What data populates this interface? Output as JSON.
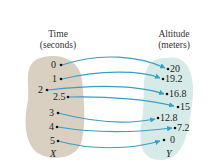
{
  "diagram": {
    "type": "function-mapping",
    "domain_header": {
      "line1": "Time",
      "line2": "(seconds)"
    },
    "range_header": {
      "line1": "Altitude",
      "line2": "(meters)"
    },
    "domain_label": "X",
    "range_label": "Y",
    "domain_values": [
      "0",
      "1",
      "2",
      "2.5",
      "3",
      "4",
      "5"
    ],
    "range_values": [
      "20",
      "19.2",
      "16.8",
      "15",
      "12.8",
      "7.2",
      "0"
    ],
    "mappings": [
      {
        "from": "0",
        "to": "20"
      },
      {
        "from": "1",
        "to": "19.2"
      },
      {
        "from": "2",
        "to": "16.8"
      },
      {
        "from": "2.5",
        "to": "15"
      },
      {
        "from": "3",
        "to": "12.8"
      },
      {
        "from": "4",
        "to": "7.2"
      },
      {
        "from": "5",
        "to": "0"
      }
    ],
    "colors": {
      "domain_fill": "#d9d0c2",
      "range_fill": "#d6ebe8",
      "arrow": "#3a9fc6",
      "text": "#222222"
    }
  }
}
